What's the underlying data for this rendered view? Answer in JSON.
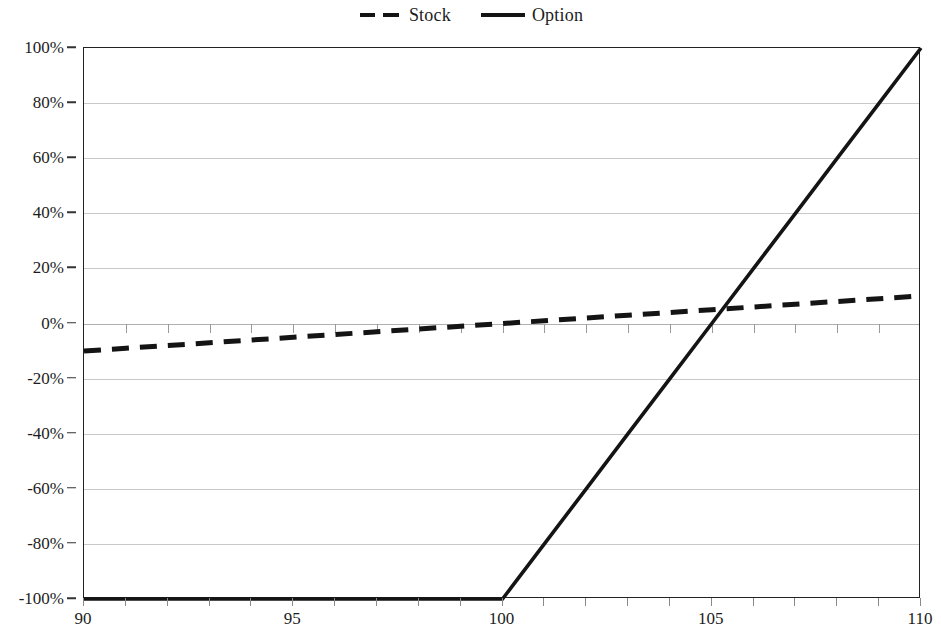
{
  "chart_data": {
    "type": "line",
    "title": "",
    "subtitle": "",
    "xlabel": "",
    "ylabel": "",
    "xlim": [
      90,
      110
    ],
    "ylim": [
      -100,
      100
    ],
    "grid": true,
    "legend_position": "top-center",
    "x_tick_labels": [
      "90",
      "95",
      "100",
      "105",
      "110"
    ],
    "x_tick_values": [
      90,
      95,
      100,
      105,
      110
    ],
    "y_tick_labels": [
      "100%",
      "80%",
      "60%",
      "40%",
      "20%",
      "0%",
      "-20%",
      "-40%",
      "-60%",
      "-80%",
      "-100%"
    ],
    "y_tick_values": [
      100,
      80,
      60,
      40,
      20,
      0,
      -20,
      -40,
      -60,
      -80,
      -100
    ],
    "x_minor_tick_interval": 1,
    "series": [
      {
        "name": "Stock",
        "style": "dashed",
        "color": "#141414",
        "x": [
          90,
          91,
          92,
          93,
          94,
          95,
          96,
          97,
          98,
          99,
          100,
          101,
          102,
          103,
          104,
          105,
          106,
          107,
          108,
          109,
          110
        ],
        "values": [
          -10,
          -9,
          -8,
          -7,
          -6,
          -5,
          -4,
          -3,
          -2,
          -1,
          0,
          1,
          2,
          3,
          4,
          5,
          6,
          7,
          8,
          9,
          10
        ]
      },
      {
        "name": "Option",
        "style": "solid",
        "color": "#141414",
        "x": [
          90,
          91,
          92,
          93,
          94,
          95,
          96,
          97,
          98,
          99,
          100,
          101,
          102,
          103,
          104,
          105,
          106,
          107,
          108,
          109,
          110
        ],
        "values": [
          -100,
          -100,
          -100,
          -100,
          -100,
          -100,
          -100,
          -100,
          -100,
          -100,
          -100,
          -80,
          -60,
          -40,
          -20,
          0,
          20,
          40,
          60,
          80,
          100
        ]
      }
    ],
    "annotations": []
  },
  "legend": {
    "entries": [
      {
        "label": "Stock",
        "marker": "dashed-line-marker"
      },
      {
        "label": "Option",
        "marker": "solid-line-marker"
      }
    ]
  },
  "colors": {
    "line": "#141414",
    "grid": "#c9c9c9",
    "axis": "#222222",
    "text": "#1c1c1c",
    "background": "#ffffff"
  }
}
